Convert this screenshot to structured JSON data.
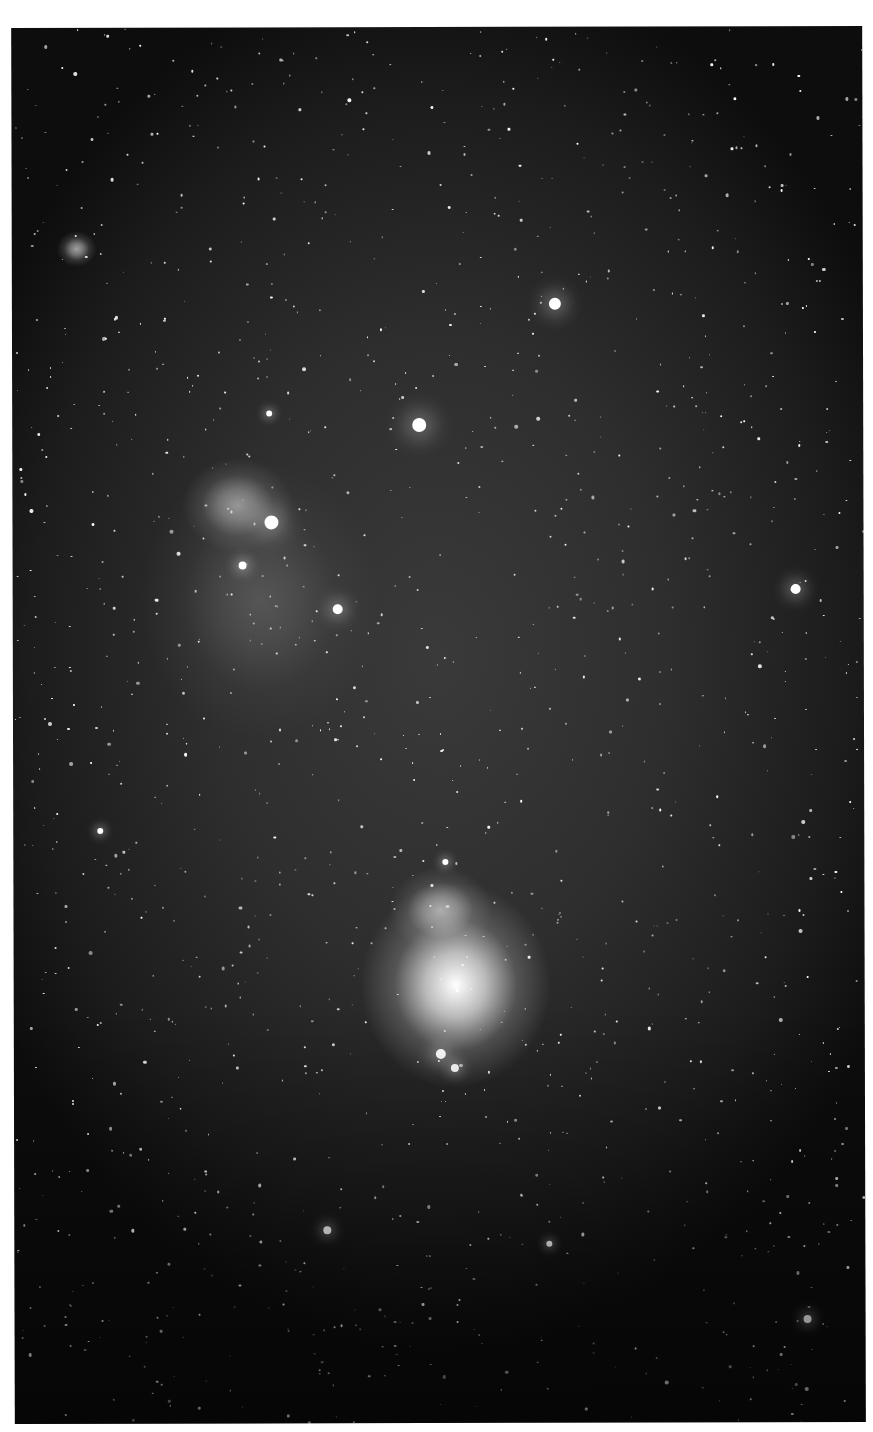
{
  "image": {
    "subject": "Wide-field astrophotograph of the Orion belt and sword region (monochrome)",
    "background_color": "#2e2e2e",
    "border_color": "#ffffff"
  },
  "features": [
    {
      "name": "orion-nebula",
      "label": "Orion Nebula (M42)",
      "x": 455,
      "y": 985,
      "rx": 48,
      "ry": 52,
      "intensity": 1.0
    },
    {
      "name": "running-man-nebula",
      "label": "Running Man Nebula",
      "x": 440,
      "y": 910,
      "rx": 26,
      "ry": 22,
      "intensity": 0.55
    },
    {
      "name": "flame-nebula",
      "label": "Flame Nebula",
      "x": 238,
      "y": 505,
      "rx": 28,
      "ry": 24,
      "intensity": 0.5
    },
    {
      "name": "horsehead-region",
      "label": "Horsehead region glow",
      "x": 260,
      "y": 600,
      "rx": 60,
      "ry": 70,
      "intensity": 0.18
    },
    {
      "name": "small-nebula-top-left",
      "label": "Small reflection nebula",
      "x": 78,
      "y": 248,
      "rx": 10,
      "ry": 9,
      "intensity": 0.6
    }
  ],
  "bright_stars": [
    {
      "name": "alnitak",
      "x": 272,
      "y": 522,
      "r": 7
    },
    {
      "name": "alnilam",
      "x": 420,
      "y": 425,
      "r": 7
    },
    {
      "name": "mintaka",
      "x": 556,
      "y": 304,
      "r": 6
    },
    {
      "name": "star-right",
      "x": 796,
      "y": 590,
      "r": 5
    },
    {
      "name": "star-sigma",
      "x": 338,
      "y": 609,
      "r": 5
    },
    {
      "name": "star-flame-lower",
      "x": 243,
      "y": 565,
      "r": 4
    },
    {
      "name": "iota-ori",
      "x": 440,
      "y": 1054,
      "r": 5
    },
    {
      "name": "star-sword-b",
      "x": 454,
      "y": 1068,
      "r": 4
    },
    {
      "name": "star-bottom-right",
      "x": 806,
      "y": 1320,
      "r": 4
    },
    {
      "name": "star-bottom-left",
      "x": 326,
      "y": 1230,
      "r": 4
    },
    {
      "name": "star-bottom-mid",
      "x": 548,
      "y": 1244,
      "r": 3
    },
    {
      "name": "star-left-mid",
      "x": 100,
      "y": 830,
      "r": 3
    },
    {
      "name": "star-top-left",
      "x": 270,
      "y": 413,
      "r": 3
    },
    {
      "name": "star-trapezium-top",
      "x": 445,
      "y": 862,
      "r": 3
    }
  ],
  "star_field": {
    "count": 1400,
    "seed": 42
  }
}
